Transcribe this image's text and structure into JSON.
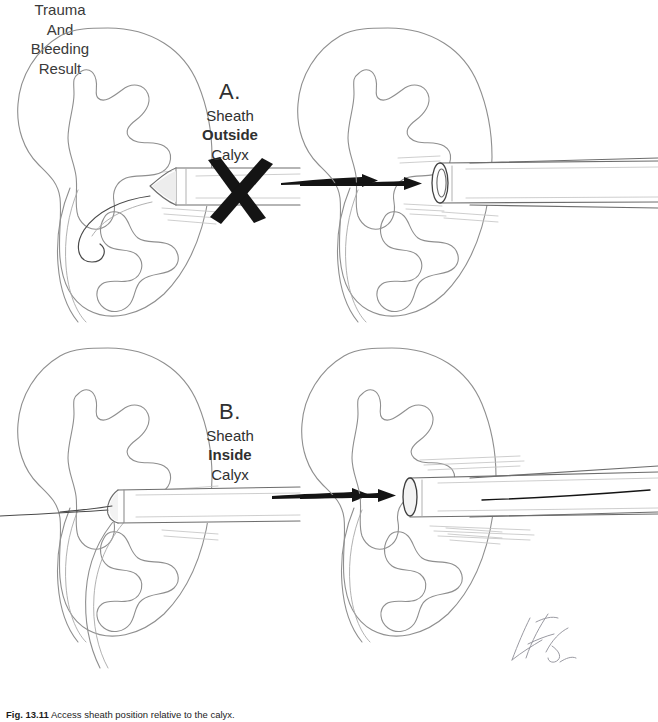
{
  "figure": {
    "caption_number": "Fig. 13.11",
    "caption_text": "Access sheath position relative to the calyx.",
    "background_color": "#ffffff",
    "pencil_line_color": "#8f8f8f",
    "ink_color": "#111111",
    "text_color": "#303030"
  },
  "panels": [
    {
      "id": "panel-a",
      "letter": "A.",
      "label_lines": [
        {
          "text": "Sheath",
          "bold": false
        },
        {
          "text": "Outside",
          "bold": true
        },
        {
          "text": "Calyx",
          "bold": false
        }
      ],
      "marker": {
        "name": "x-mark",
        "shown": true,
        "meaning": "incorrect technique"
      },
      "arrow": {
        "name": "progress-arrow",
        "direction": "right"
      },
      "result_label": {
        "lines": [
          "Trauma",
          "And",
          "Bleeding",
          "Result"
        ]
      },
      "left_kidney": {
        "name": "kidney-outline",
        "sheath_state": "dilator tip abuts infundibulum, outside calyx"
      },
      "right_kidney": {
        "name": "kidney-outline",
        "sheath_state": "open sheath lumen stops short of calyx"
      }
    },
    {
      "id": "panel-b",
      "letter": "B.",
      "label_lines": [
        {
          "text": "Sheath",
          "bold": false
        },
        {
          "text": "Inside",
          "bold": true
        },
        {
          "text": "Calyx",
          "bold": false
        }
      ],
      "marker": {
        "name": "x-mark",
        "shown": false,
        "meaning": "correct technique"
      },
      "arrow": {
        "name": "progress-arrow",
        "direction": "right"
      },
      "result_label": {
        "lines": []
      },
      "left_kidney": {
        "name": "kidney-outline",
        "sheath_state": "sheath advanced with tip entering calyx"
      },
      "right_kidney": {
        "name": "kidney-outline",
        "sheath_state": "open sheath lumen seated inside calyx"
      }
    }
  ],
  "signature": {
    "name": "artist-signature",
    "visible": true
  }
}
